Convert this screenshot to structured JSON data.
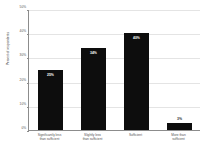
{
  "chart_data": {
    "type": "bar",
    "title": "",
    "subtitle": "",
    "xlabel": "",
    "ylabel": "Percent of respondents",
    "categories": [
      "Significantly less\nthan sufficient",
      "Slightly less\nthan sufficient",
      "Sufficient",
      "More than\nsufficient"
    ],
    "values": [
      25,
      34,
      40,
      3
    ],
    "data_labels": [
      "25%",
      "34%",
      "40%",
      "3%"
    ],
    "ylim": [
      0,
      50
    ],
    "ytick_values": [
      0,
      10,
      20,
      30,
      40,
      50
    ],
    "ytick_labels": [
      "0%",
      "10%",
      "20%",
      "30%",
      "40%",
      "50%"
    ],
    "grid": true,
    "legend": false,
    "legend_position": "none",
    "bar_color": "#0d0d0d",
    "background_color": "#ffffff",
    "gridline_color": "#e4e4e4",
    "axis_color": "#8c8c8c",
    "label_inside_color": "#ffffff",
    "label_outside_color": "#2e2e2e"
  }
}
